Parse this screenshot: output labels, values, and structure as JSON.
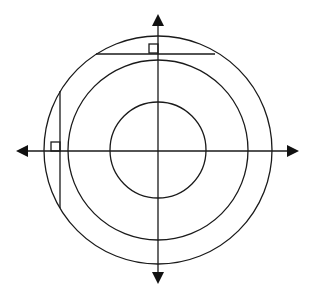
{
  "figure": {
    "colors": {
      "line": "#1a1a1a",
      "arrowhead": "#111111",
      "background": "#ffffff"
    },
    "center": {
      "x": 158,
      "y": 150
    },
    "circles": [
      {
        "name": "inner",
        "r": 48
      },
      {
        "name": "middle",
        "r": 90
      },
      {
        "name": "outer",
        "r": 114
      }
    ],
    "axes": {
      "horizontal": {
        "x1": 16,
        "x2": 299,
        "y": 151
      },
      "vertical": {
        "x": 158,
        "y1": 14,
        "y2": 284
      }
    },
    "chords": [
      {
        "name": "horizontal-chord",
        "x1": 96,
        "y1": 54,
        "x2": 215,
        "y2": 54
      },
      {
        "name": "vertical-chord",
        "x1": 60,
        "y1": 91,
        "x2": 60,
        "y2": 208
      }
    ],
    "right_angle_markers": [
      {
        "name": "top-marker",
        "x": 149,
        "y": 44,
        "size": 9
      },
      {
        "name": "left-marker",
        "x": 51,
        "y": 142,
        "size": 9
      }
    ]
  }
}
